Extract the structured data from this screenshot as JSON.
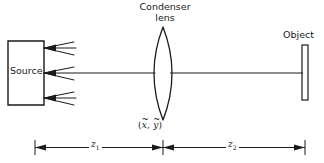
{
  "diagram": {
    "background_color": "#ffffff",
    "stroke_color": "#1a1a1a",
    "components": {
      "source": {
        "label": "Source",
        "shape": "open-left-rectangle",
        "x": 8,
        "y": 41,
        "width": 36,
        "height": 64
      },
      "condenser_lens": {
        "label_line1": "Condenser",
        "label_line2": "lens",
        "label": "Condenser lens",
        "shape": "biconvex-lens",
        "center_x": 163,
        "top_y": 27,
        "bottom_y": 120
      },
      "lens_center_label": {
        "open_paren": "(",
        "x_symbol": "x",
        "comma": ",",
        "y_symbol": "y",
        "close_paren": ")",
        "full": "( x, y )",
        "accent": "tilde"
      },
      "object": {
        "label": "Object",
        "shape": "vertical-bar",
        "x": 302,
        "y": 45,
        "width": 6,
        "height": 55
      },
      "optical_axis": {
        "y": 73,
        "from_x": 44,
        "to_x": 305
      }
    },
    "rays": {
      "count": 3,
      "arrowhead_direction": "left",
      "arrowhead_prongs": 3,
      "y_positions": [
        48,
        73,
        98
      ]
    },
    "dimensions": {
      "baseline_y": 147,
      "ticks_x": [
        35,
        163,
        305
      ],
      "segments": [
        {
          "name": "z1",
          "label": "z",
          "subscript": "1",
          "from_x": 35,
          "to_x": 163
        },
        {
          "name": "z2",
          "label": "z",
          "subscript": "2",
          "from_x": 163,
          "to_x": 305
        }
      ]
    }
  }
}
